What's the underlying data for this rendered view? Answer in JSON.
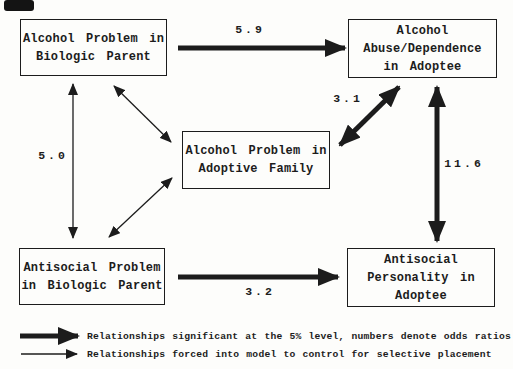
{
  "diagram": {
    "colors": {
      "ink": "#1c1c1c",
      "background": "#fdfdfb"
    },
    "boxes": {
      "alcohol_biologic_parent": {
        "lines": [
          "Alcohol Problem in",
          "Biologic Parent"
        ]
      },
      "alcohol_adoptee": {
        "lines": [
          "Alcohol",
          "Abuse/Dependence",
          "in Adoptee"
        ]
      },
      "alcohol_adoptive_family": {
        "lines": [
          "Alcohol Problem in",
          "Adoptive Family"
        ]
      },
      "antisocial_biologic_parent": {
        "lines": [
          "Antisocial Problem",
          "in Biologic Parent"
        ]
      },
      "antisocial_adoptee": {
        "lines": [
          "Antisocial",
          "Personality in",
          "Adoptee"
        ]
      }
    },
    "odds_ratios": {
      "biologic_alcohol_to_adoptee_alcohol": "5.9",
      "adoptive_family_to_adoptee_alcohol": "3.1",
      "adoptee_alcohol_antisocial_comorbidity": "11.6",
      "biologic_antisocial_to_adoptee_antisocial": "3.2",
      "biologic_parent_problems_correlation": "5.0"
    },
    "legend": {
      "thick_arrow": "Relationships significant at the 5% level, numbers denote odds ratios",
      "thin_arrow": "Relationships forced into model to control for selective placement"
    }
  }
}
